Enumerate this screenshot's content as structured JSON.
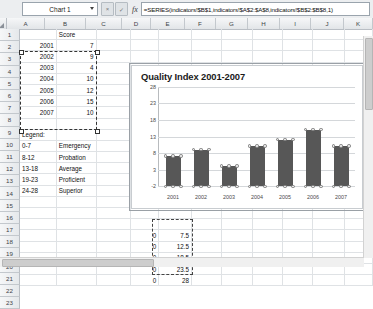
{
  "window": {
    "app": "spreadsheet"
  },
  "formula_bar": {
    "name_box": "Chart 1",
    "cancel_label": "×",
    "accept_label": "✓",
    "fx_label": "fx",
    "formula": "=SERIES(indicators!$B$1,indicators!$A$2:$A$8,indicators!$B$2:$B$8,1)"
  },
  "grid": {
    "columns": [
      "A",
      "B",
      "C",
      "D",
      "E",
      "F",
      "G",
      "H",
      "I",
      "J",
      "K"
    ],
    "rows": [
      "1",
      "2",
      "3",
      "4",
      "5",
      "6",
      "7",
      "8",
      "9",
      "10",
      "11",
      "12",
      "13",
      "14",
      "15",
      "16",
      "17",
      "18",
      "19",
      "20",
      "21",
      "22",
      "23"
    ],
    "cells": {
      "B1": "Score",
      "A2": "2001",
      "B2": "7",
      "A3": "2002",
      "B3": "9",
      "A4": "2003",
      "B4": "4",
      "A5": "2004",
      "B5": "10",
      "A6": "2005",
      "B6": "12",
      "A7": "2006",
      "B7": "15",
      "A8": "2007",
      "B8": "10",
      "A10": "Legend:",
      "A11": "0-7",
      "B11": "Emergency",
      "A12": "8-12",
      "B12": "Probation",
      "A13": "13-18",
      "B13": "Average",
      "A14": "19-23",
      "B14": "Proficient",
      "A15": "24-28",
      "B15": "Superior",
      "D19": "0",
      "E19": "7.5",
      "D20": "0",
      "E20": "12.5",
      "D21": "0",
      "E21": "18.5",
      "D22": "0",
      "E22": "23.5",
      "D23": "0",
      "E23": "28"
    }
  },
  "chart_data": {
    "type": "bar",
    "title": "Quality Index 2001-2007",
    "xlabel": "",
    "ylabel": "",
    "categories": [
      "2001",
      "2002",
      "2003",
      "2004",
      "2005",
      "2006",
      "2007"
    ],
    "values": [
      7,
      9,
      4,
      10,
      12,
      15,
      10
    ],
    "series": [
      {
        "name": "Score",
        "values": [
          7,
          9,
          4,
          10,
          12,
          15,
          10
        ]
      }
    ],
    "ylim": [
      -2,
      28
    ],
    "yticks": [
      "28",
      "23",
      "18",
      "13",
      "8",
      "3",
      "-2"
    ],
    "grid": true,
    "legend": "none",
    "bar_color": "#575757",
    "selected": true
  }
}
